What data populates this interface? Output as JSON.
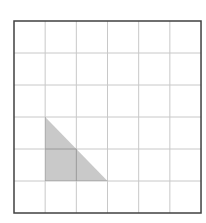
{
  "diagram": {
    "type": "grid-with-shaded-triangle",
    "grid": {
      "columns": 6,
      "rows": 6,
      "origin_px": [
        14,
        21
      ],
      "cell_w": 31.17,
      "cell_h": 32,
      "line_color": "#c8c8c8",
      "border_color": "#404040"
    },
    "shape": {
      "kind": "right-triangle",
      "vertices_grid": [
        [
          1,
          3
        ],
        [
          1,
          5
        ],
        [
          3,
          5
        ]
      ],
      "fill_color": "#c9c9c9"
    }
  }
}
